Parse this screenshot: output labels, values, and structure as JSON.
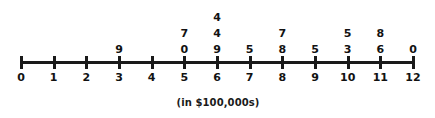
{
  "chart_data": {
    "type": "scatter",
    "plot_style": "dot-plot-with-value-labels",
    "title": "",
    "subtitle": "",
    "xlabel": "(in $100,000s)",
    "ylabel": "",
    "xlim": [
      0,
      12
    ],
    "grid": false,
    "legend": null,
    "tick_labels": [
      "0",
      "1",
      "2",
      "3",
      "4",
      "5",
      "6",
      "7",
      "8",
      "9",
      "10",
      "11",
      "12"
    ],
    "x": [
      0,
      1,
      2,
      3,
      4,
      5,
      6,
      7,
      8,
      9,
      10,
      11,
      12
    ],
    "counts": [
      0,
      0,
      0,
      1,
      0,
      2,
      3,
      1,
      2,
      1,
      2,
      2,
      1
    ],
    "columns": [
      {
        "x": 0,
        "tick": "0",
        "values": []
      },
      {
        "x": 1,
        "tick": "1",
        "values": []
      },
      {
        "x": 2,
        "tick": "2",
        "values": []
      },
      {
        "x": 3,
        "tick": "3",
        "values": [
          "9"
        ]
      },
      {
        "x": 4,
        "tick": "4",
        "values": []
      },
      {
        "x": 5,
        "tick": "5",
        "values": [
          "0",
          "7"
        ]
      },
      {
        "x": 6,
        "tick": "6",
        "values": [
          "9",
          "4",
          "4"
        ]
      },
      {
        "x": 7,
        "tick": "7",
        "values": [
          "5"
        ]
      },
      {
        "x": 8,
        "tick": "8",
        "values": [
          "8",
          "7"
        ]
      },
      {
        "x": 9,
        "tick": "9",
        "values": [
          "5"
        ]
      },
      {
        "x": 10,
        "tick": "10",
        "values": [
          "3",
          "5"
        ]
      },
      {
        "x": 11,
        "tick": "11",
        "values": [
          "6",
          "8"
        ]
      },
      {
        "x": 12,
        "tick": "12",
        "values": [
          "0"
        ]
      }
    ],
    "annotations": [
      "(in $100,000s)"
    ],
    "colors": {
      "axis": "#1a1a1a",
      "text": "#121212",
      "background": "#ffffff"
    }
  },
  "caption": {
    "text": "(in $100,000s)"
  }
}
